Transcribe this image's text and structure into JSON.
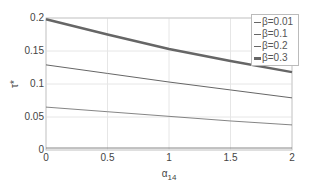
{
  "chart_data": {
    "type": "line",
    "title": "",
    "xlabel": "α14",
    "ylabel": "τ*",
    "xlim": [
      0,
      2
    ],
    "ylim": [
      0,
      0.2
    ],
    "xticks": [
      "0",
      "0.5",
      "1",
      "1.5",
      "2"
    ],
    "yticks": [
      "0",
      "0.05",
      "0.1",
      "0.15",
      "0.2"
    ],
    "grid": true,
    "legend_position": "upper right",
    "x": [
      0,
      0.5,
      1,
      1.5,
      2
    ],
    "series": [
      {
        "name": "β=0.01",
        "values": [
          0.003,
          0.003,
          0.003,
          0.003,
          0.003
        ],
        "width": 0.8
      },
      {
        "name": "β=0.1",
        "values": [
          0.065,
          0.058,
          0.051,
          0.044,
          0.038
        ],
        "width": 0.8
      },
      {
        "name": "β=0.2",
        "values": [
          0.129,
          0.116,
          0.103,
          0.091,
          0.079
        ],
        "width": 1
      },
      {
        "name": "β=0.3",
        "values": [
          0.198,
          0.175,
          0.153,
          0.135,
          0.118
        ],
        "width": 2.5
      }
    ]
  },
  "axis": {
    "xlabel_main": "α",
    "xlabel_sub": "14",
    "ylabel": "τ*"
  },
  "legend": [
    "β=0.01",
    "β=0.1",
    "β=0.2",
    "β=0.3"
  ]
}
